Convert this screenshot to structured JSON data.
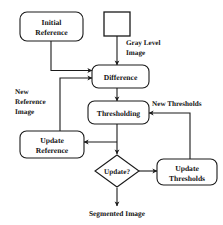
{
  "diagram": {
    "type": "flowchart",
    "colors": {
      "background": "#ffffff",
      "stroke": "#1a1a1a",
      "text": "#141414"
    },
    "nodes": [
      {
        "id": "initial-reference",
        "shape": "rounded-rectangle",
        "label_line1": "Initial",
        "label_line2": "Reference"
      },
      {
        "id": "gray-level-source",
        "shape": "rectangle",
        "label": ""
      },
      {
        "id": "difference",
        "shape": "rounded-rectangle",
        "label": "Difference"
      },
      {
        "id": "thresholding",
        "shape": "rounded-rectangle",
        "label": "Thresholding"
      },
      {
        "id": "update-reference",
        "shape": "rounded-rectangle",
        "label_line1": "Update",
        "label_line2": "Reference"
      },
      {
        "id": "update-decision",
        "shape": "diamond",
        "label": "Update?"
      },
      {
        "id": "update-thresholds",
        "shape": "rounded-rectangle",
        "label_line1": "Update",
        "label_line2": "Thresholds"
      }
    ],
    "edge_labels": {
      "gray_level_line1": "Gray Level",
      "gray_level_line2": "Image",
      "new_reference_line1": "New",
      "new_reference_line2": "Reference",
      "new_reference_line3": "Image",
      "new_thresholds": "New Thresholds"
    },
    "terminal": {
      "output_label": "Segmented Image"
    }
  }
}
